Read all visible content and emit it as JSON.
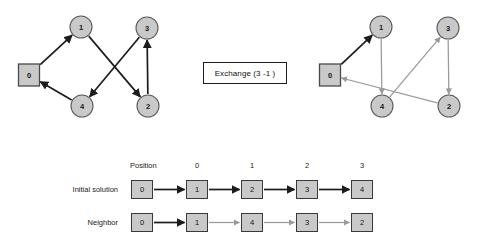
{
  "caption": {
    "exchange_label": "Exchange (3 -1 )"
  },
  "left_graph": {
    "title": "initial-solution-tour",
    "nodes": [
      {
        "id": "0",
        "label": "0",
        "shape": "square",
        "x": 29,
        "y": 75
      },
      {
        "id": "1",
        "label": "1",
        "shape": "circle",
        "x": 81,
        "y": 27
      },
      {
        "id": "3",
        "label": "3",
        "shape": "circle",
        "x": 147,
        "y": 28
      },
      {
        "id": "4",
        "label": "4",
        "shape": "circle",
        "x": 82,
        "y": 106
      },
      {
        "id": "2",
        "label": "2",
        "shape": "circle",
        "x": 148,
        "y": 106
      }
    ],
    "edges": [
      {
        "from": "0",
        "to": "1",
        "color": "dark"
      },
      {
        "from": "1",
        "to": "2",
        "color": "dark"
      },
      {
        "from": "2",
        "to": "3",
        "color": "dark"
      },
      {
        "from": "3",
        "to": "4",
        "color": "dark"
      },
      {
        "from": "4",
        "to": "0",
        "color": "dark"
      }
    ]
  },
  "right_graph": {
    "title": "neighbor-solution-tour",
    "nodes": [
      {
        "id": "0",
        "label": "0",
        "shape": "square",
        "x": 330,
        "y": 75
      },
      {
        "id": "1",
        "label": "1",
        "shape": "circle",
        "x": 381,
        "y": 27
      },
      {
        "id": "3",
        "label": "3",
        "shape": "circle",
        "x": 448,
        "y": 28
      },
      {
        "id": "4",
        "label": "4",
        "shape": "circle",
        "x": 382,
        "y": 106
      },
      {
        "id": "2",
        "label": "2",
        "shape": "circle",
        "x": 449,
        "y": 106
      }
    ],
    "edges": [
      {
        "from": "0",
        "to": "1",
        "color": "dark"
      },
      {
        "from": "1",
        "to": "4",
        "color": "gray"
      },
      {
        "from": "4",
        "to": "3",
        "color": "gray"
      },
      {
        "from": "3",
        "to": "2",
        "color": "gray"
      },
      {
        "from": "2",
        "to": "0",
        "color": "gray"
      }
    ]
  },
  "sequence": {
    "position_header": "Position",
    "position_numbers": [
      "0",
      "1",
      "2",
      "3"
    ],
    "rows": [
      {
        "label": "Initial solution",
        "cells": [
          "0",
          "1",
          "2",
          "3",
          "4"
        ],
        "arrow_colors": [
          "dark",
          "dark",
          "dark",
          "dark"
        ]
      },
      {
        "label": "Neighbor",
        "cells": [
          "0",
          "1",
          "4",
          "3",
          "2"
        ],
        "arrow_colors": [
          "dark",
          "gray",
          "gray",
          "gray"
        ]
      }
    ]
  },
  "colors": {
    "node_fill": "#c9c9c9",
    "node_stroke": "#5c5c5c",
    "edge_dark": "#1c1c1c",
    "edge_gray": "#9a9a9a",
    "background": "#ffffff",
    "text": "#1a1a1a"
  }
}
